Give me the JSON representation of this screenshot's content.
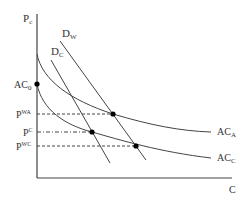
{
  "diagram": {
    "axes": {
      "y_label": "P",
      "y_label_sub": "c",
      "x_label": "C"
    },
    "curves": {
      "demand_w": {
        "label": "D",
        "sub": "W"
      },
      "demand_c": {
        "label": "D",
        "sub": "C"
      },
      "ac_a": {
        "label": "AC",
        "sub": "A"
      },
      "ac_c": {
        "label": "AC",
        "sub": "C"
      }
    },
    "price_levels": {
      "ac0": {
        "label": "AC",
        "sub": "0"
      },
      "pwa": {
        "label": "P",
        "sup": "WA"
      },
      "pc": {
        "label": "P",
        "sup": "C"
      },
      "pwc": {
        "label": "P",
        "sup": "WC"
      }
    },
    "colors": {
      "line": "#444444",
      "point": "#000000"
    }
  }
}
